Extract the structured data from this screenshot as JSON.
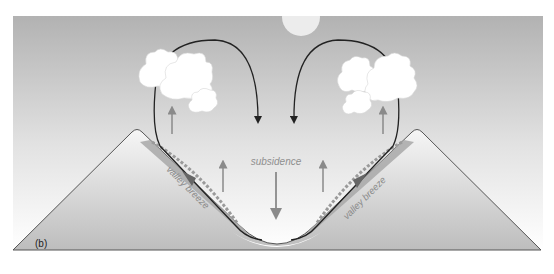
{
  "figure": {
    "panel_label": "(b)",
    "labels": {
      "subsidence": "subsidence",
      "valley_breeze_left": "valley breeze",
      "valley_breeze_right": "valley breeze"
    },
    "colors": {
      "sky_top": "#b4b4b4",
      "sky_bottom": "#ffffff",
      "mountain_top": "#f4f4f4",
      "mountain_bottom": "#c2c2c2",
      "slope_layer": "#a9a9a9",
      "circulation_line": "#222222",
      "updraft_arrow": "#8a8a8a",
      "label_text": "#8f8f8f",
      "cloud": "#ffffff",
      "sun": "#eeeeee"
    },
    "elements": {
      "sun": "sun",
      "clouds_left": 3,
      "clouds_right": 3,
      "updraft_arrows": 4,
      "subsidence_arrows": 1
    }
  }
}
